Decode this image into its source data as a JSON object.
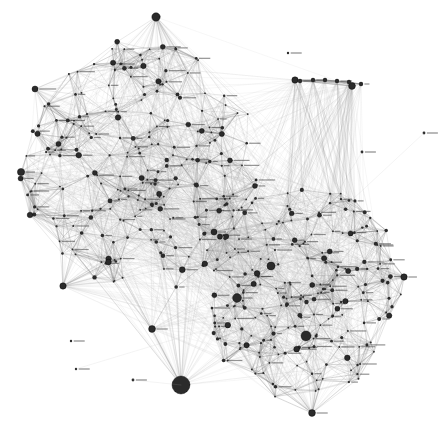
{
  "canvas": {
    "width": 447,
    "height": 447,
    "background": "#ffffff",
    "title": "Force-directed network graph",
    "description": "Two dense overlapping communities of a force-directed social / co-occurrence network, drawn with hairline gray edges and small dark circular nodes with tiny text labels."
  },
  "style": {
    "edge_color": "#6f6f6f",
    "edge_color_faint": "#b4b4b4",
    "edge_width": 0.35,
    "node_fill": "#2b2b2b",
    "node_stroke": "#000000",
    "label_color": "#3a3a3a",
    "core_gray": "#8a8a8a"
  },
  "legend": {
    "visible": false
  },
  "chart_data": {
    "type": "network",
    "title": "",
    "xlabel": "",
    "ylabel": "",
    "xlim": [
      0,
      447
    ],
    "ylim": [
      0,
      447
    ],
    "grid": false,
    "legend_position": "none",
    "layout": "force-directed",
    "node_count": 520,
    "edge_count": 7400,
    "communities": [
      {
        "id": "cluster-upper-left",
        "label": "",
        "center_x": 140,
        "center_y": 165,
        "radius_x": 118,
        "radius_y": 128,
        "node_count": 250,
        "density": 0.46
      },
      {
        "id": "cluster-lower-right",
        "label": "",
        "center_x": 300,
        "center_y": 290,
        "radius_x": 100,
        "radius_y": 108,
        "node_count": 230,
        "density": 0.42
      }
    ],
    "hubs": [
      {
        "id": "hub-top",
        "x": 156,
        "y": 17,
        "size": 4.2,
        "spokes": 46,
        "label": ""
      },
      {
        "id": "hub-left",
        "x": 21,
        "y": 172,
        "size": 3.6,
        "spokes": 40,
        "label": ""
      },
      {
        "id": "hub-upper-left",
        "x": 35,
        "y": 89,
        "size": 3.0,
        "spokes": 26,
        "label": ""
      },
      {
        "id": "hub-left-lower",
        "x": 30,
        "y": 215,
        "size": 2.8,
        "spokes": 22,
        "label": ""
      },
      {
        "id": "hub-bottom-left",
        "x": 63,
        "y": 286,
        "size": 3.2,
        "spokes": 30,
        "label": ""
      },
      {
        "id": "hub-bottom-big",
        "x": 181,
        "y": 385,
        "size": 9.0,
        "spokes": 52,
        "label": ""
      },
      {
        "id": "hub-bottom-mid",
        "x": 152,
        "y": 329,
        "size": 3.4,
        "spokes": 28,
        "label": ""
      },
      {
        "id": "hub-bottom-right",
        "x": 312,
        "y": 413,
        "size": 3.4,
        "spokes": 34,
        "label": ""
      },
      {
        "id": "hub-right",
        "x": 404,
        "y": 277,
        "size": 3.2,
        "spokes": 28,
        "label": ""
      },
      {
        "id": "hub-fan-right",
        "x": 352,
        "y": 86,
        "size": 3.4,
        "spokes": 24,
        "label": ""
      },
      {
        "id": "hub-fan-left",
        "x": 295,
        "y": 80,
        "size": 3.2,
        "spokes": 22,
        "label": ""
      },
      {
        "id": "hub-core-right",
        "x": 306,
        "y": 336,
        "size": 5.0,
        "spokes": 36,
        "label": ""
      },
      {
        "id": "hub-core-mid",
        "x": 237,
        "y": 298,
        "size": 4.4,
        "spokes": 30,
        "label": ""
      },
      {
        "id": "hub-core-up",
        "x": 271,
        "y": 266,
        "size": 4.0,
        "spokes": 26,
        "label": ""
      },
      {
        "id": "hub-mid-bridge",
        "x": 214,
        "y": 232,
        "size": 3.0,
        "spokes": 24,
        "label": ""
      }
    ],
    "isolated_nodes": [
      {
        "id": "iso-1",
        "x": 71,
        "y": 341,
        "size": 1.2,
        "label": "node"
      },
      {
        "id": "iso-2",
        "x": 76,
        "y": 369,
        "size": 1.2,
        "label": "node"
      },
      {
        "id": "iso-3",
        "x": 288,
        "y": 53,
        "size": 1.2,
        "label": "node"
      },
      {
        "id": "iso-4",
        "x": 424,
        "y": 133,
        "size": 1.4,
        "label": "node"
      },
      {
        "id": "iso-5",
        "x": 133,
        "y": 380,
        "size": 1.4,
        "label": "node"
      },
      {
        "id": "iso-6",
        "x": 362,
        "y": 152,
        "size": 1.4,
        "label": "node"
      }
    ],
    "fan_row_top_right": {
      "anchor_x": 352,
      "anchor_y": 86,
      "members": [
        {
          "x": 300,
          "y": 81
        },
        {
          "x": 313,
          "y": 80
        },
        {
          "x": 325,
          "y": 80
        },
        {
          "x": 337,
          "y": 81
        },
        {
          "x": 349,
          "y": 82
        },
        {
          "x": 361,
          "y": 84
        }
      ]
    },
    "notes": [
      "Edges are hairline and heavily overplotted, producing solid mid-gray fill in both community cores.",
      "Node labels are rendered at sub-pixel size and are not legible at 447x447.",
      "A small number of degree-1 / degree-0 nodes sit in the white margin at lower-left and upper-right."
    ]
  }
}
